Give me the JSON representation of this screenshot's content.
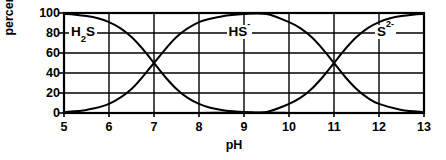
{
  "chart_data": {
    "type": "line",
    "title": "",
    "subtitle": "",
    "xlabel": "pH",
    "ylabel": "percent",
    "xlim": [
      5,
      13
    ],
    "ylim": [
      0,
      100
    ],
    "xticks": [
      5,
      6,
      7,
      8,
      9,
      10,
      11,
      12,
      13
    ],
    "xtick_labels": [
      "5",
      "6",
      "7",
      "8",
      "9",
      "10",
      "11",
      "12",
      "13"
    ],
    "yticks": [
      0,
      20,
      40,
      60,
      80,
      100
    ],
    "ytick_labels": [
      "0",
      "20",
      "40",
      "60",
      "80",
      "100"
    ],
    "grid": true,
    "grid_color": "#000000",
    "legend_position": "inline-annotations",
    "line_color": "#000000",
    "background": "#ffffff",
    "annotations": [
      {
        "text_html": "H<sub>2</sub>S",
        "text": "H2S",
        "x": 5.6,
        "y": 80
      },
      {
        "text_html": "HS<sup>-</sup>",
        "text": "HS-",
        "x": 9.1,
        "y": 80
      },
      {
        "text_html": "S<sup>2-</sup>",
        "text": "S2-",
        "x": 12.4,
        "y": 80
      }
    ],
    "series": [
      {
        "name": "H2S",
        "pKa": 7.0,
        "x": [
          5,
          5.25,
          5.5,
          5.75,
          6,
          6.25,
          6.5,
          6.75,
          7,
          7.25,
          7.5,
          7.75,
          8,
          8.25,
          8.5,
          8.75,
          9,
          9.5,
          10,
          10.5,
          11,
          11.5,
          12,
          12.5,
          13
        ],
        "values": [
          99,
          98.2,
          96.9,
          94.7,
          90.9,
          84.9,
          76,
          64,
          50,
          36,
          24,
          15.1,
          9.1,
          5.3,
          3.1,
          1.8,
          1,
          0.3,
          0.1,
          0,
          0,
          0,
          0,
          0,
          0
        ]
      },
      {
        "name": "HS-",
        "pKa1": 7.0,
        "pKa2": 11.0,
        "x": [
          5,
          5.5,
          6,
          6.5,
          7,
          7.5,
          8,
          8.5,
          9,
          9.5,
          10,
          10.25,
          10.5,
          10.75,
          11,
          11.25,
          11.5,
          11.75,
          12,
          12.5,
          13
        ],
        "values": [
          1,
          3.1,
          9.1,
          24,
          50,
          76,
          90.8,
          96.6,
          99,
          98.9,
          90.8,
          84.8,
          75.9,
          63.9,
          50,
          36,
          24,
          15.1,
          9.1,
          3.1,
          1
        ]
      },
      {
        "name": "S2-",
        "pKa": 11.0,
        "x": [
          5,
          6,
          7,
          8,
          8.5,
          9,
          9.5,
          10,
          10.25,
          10.5,
          10.75,
          11,
          11.25,
          11.5,
          11.75,
          12,
          12.25,
          12.5,
          12.75,
          13
        ],
        "values": [
          0,
          0,
          0,
          0.1,
          0.2,
          0.5,
          1.1,
          9.1,
          15.1,
          24,
          36,
          50,
          64,
          76,
          84.9,
          90.9,
          94.7,
          96.9,
          98.2,
          99
        ]
      }
    ]
  },
  "axes": {
    "x_title": "pH",
    "y_title": "percent"
  }
}
